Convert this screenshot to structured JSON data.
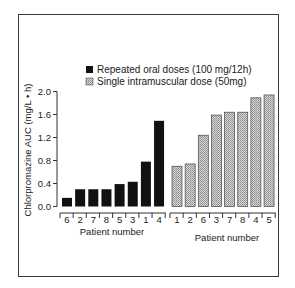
{
  "chart_data": {
    "type": "bar",
    "title": "",
    "ylabel": "Chlorpromazine AUC (mg/L • h)",
    "ylim": [
      0.0,
      2.0
    ],
    "yticks": [
      "0.0",
      "0.4",
      "0.8",
      "1.2",
      "1.6",
      "2.0"
    ],
    "grid": false,
    "legend_position": "top",
    "series": [
      {
        "name": "Repeated oral doses (100 mg/12h)",
        "fill": "solid-black",
        "color": "#111111",
        "xlabel": "Patient number",
        "categories": [
          "6",
          "2",
          "7",
          "8",
          "5",
          "3",
          "1",
          "4"
        ],
        "values": [
          0.15,
          0.3,
          0.3,
          0.3,
          0.39,
          0.43,
          0.78,
          1.49
        ]
      },
      {
        "name": "Single intramuscular dose (50mg)",
        "fill": "stippled-gray",
        "color": "#bdbdbd",
        "xlabel": "Patient number",
        "categories": [
          "1",
          "2",
          "6",
          "3",
          "7",
          "8",
          "4",
          "5"
        ],
        "values": [
          0.7,
          0.74,
          1.24,
          1.59,
          1.64,
          1.64,
          1.89,
          1.94
        ]
      }
    ]
  },
  "legend": {
    "oral_label": "Repeated oral doses (100 mg/12h)",
    "im_label": "Single intramuscular dose (50mg)"
  },
  "axes": {
    "ylabel": "Chlorpromazine AUC (mg/L • h)",
    "xlabel_oral": "Patient number",
    "xlabel_im": "Patient number"
  }
}
